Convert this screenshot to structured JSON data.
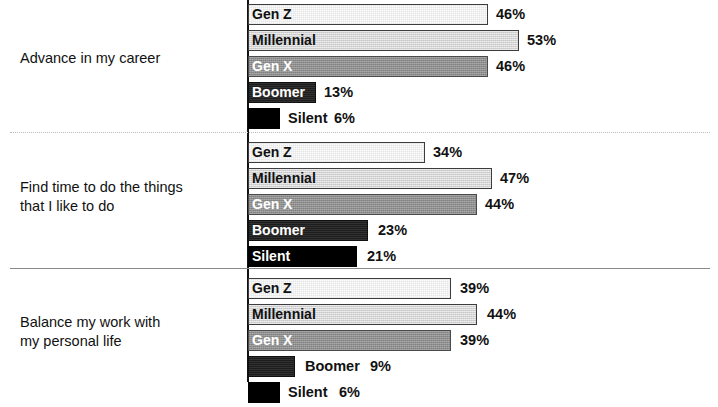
{
  "chart_data": {
    "type": "bar",
    "orientation": "horizontal",
    "title": "",
    "subtitle": "",
    "xlabel": "",
    "ylabel": "",
    "xlim": [
      0,
      60
    ],
    "grid": false,
    "legend": "inline-bar-labels",
    "value_suffix": "%",
    "px_per_percent": 5.2,
    "axis_x_px": 248,
    "series": [
      {
        "name": "Gen Z",
        "values": [
          46,
          34,
          39
        ]
      },
      {
        "name": "Millennial",
        "values": [
          53,
          47,
          44
        ]
      },
      {
        "name": "Gen X",
        "values": [
          46,
          44,
          39
        ]
      },
      {
        "name": "Boomer",
        "values": [
          13,
          23,
          9
        ]
      },
      {
        "name": "Silent",
        "values": [
          6,
          21,
          6
        ]
      }
    ],
    "categories": [
      "Advance in my career",
      "Find time to do the things that I like to do",
      "Balance my work with my personal life"
    ],
    "colors": {
      "gen_z": "#fbfbfb",
      "millennial": "#d4d4d4",
      "gen_x": "#8f8f8f",
      "boomer": "#1d1d1d",
      "silent": "#000000",
      "axis": "#111111",
      "separator_dotted": "#bdbdbd",
      "separator_solid": "#8a8a8a",
      "text": "#111111"
    }
  },
  "groups": [
    {
      "label": "Advance in my career",
      "top": 4,
      "label_top": 49,
      "bars": [
        {
          "name": "Gen Z",
          "value": "46%",
          "label": "Gen Z",
          "width": 240,
          "label_inside": true,
          "label_color": "dark",
          "value_left": 248
        },
        {
          "name": "Millennial",
          "value": "53%",
          "label": "Millennial",
          "width": 271,
          "label_inside": true,
          "label_color": "dark",
          "value_left": 279
        },
        {
          "name": "Gen X",
          "value": "46%",
          "label": "Gen X",
          "width": 240,
          "label_inside": true,
          "label_color": "light",
          "value_left": 248
        },
        {
          "name": "Boomer",
          "value": "13%",
          "label": "Boomer",
          "width": 68,
          "label_inside": true,
          "label_color": "light",
          "value_left": 76
        },
        {
          "name": "Silent",
          "value": "6%",
          "label": "Silent",
          "width": 32,
          "label_inside": false,
          "label_color": "dark",
          "label_left": 40,
          "value_left": 86
        }
      ]
    },
    {
      "label": "Find time to do the things\nthat I like to do",
      "top": 142,
      "label_top": 178,
      "bars": [
        {
          "name": "Gen Z",
          "value": "34%",
          "label": "Gen Z",
          "width": 177,
          "label_inside": true,
          "label_color": "dark",
          "value_left": 185
        },
        {
          "name": "Millennial",
          "value": "47%",
          "label": "Millennial",
          "width": 244,
          "label_inside": true,
          "label_color": "dark",
          "value_left": 252
        },
        {
          "name": "Gen X",
          "value": "44%",
          "label": "Gen X",
          "width": 229,
          "label_inside": true,
          "label_color": "light",
          "value_left": 237
        },
        {
          "name": "Boomer",
          "value": "23%",
          "label": "Boomer",
          "width": 120,
          "label_inside": true,
          "label_color": "light",
          "value_left": 130
        },
        {
          "name": "Silent",
          "value": "21%",
          "label": "Silent",
          "width": 109,
          "label_inside": true,
          "label_color": "light",
          "value_left": 119
        }
      ]
    },
    {
      "label": "Balance my work with\nmy personal life",
      "top": 278,
      "label_top": 313,
      "bars": [
        {
          "name": "Gen Z",
          "value": "39%",
          "label": "Gen Z",
          "width": 203,
          "label_inside": true,
          "label_color": "dark",
          "value_left": 212
        },
        {
          "name": "Millennial",
          "value": "44%",
          "label": "Millennial",
          "width": 229,
          "label_inside": true,
          "label_color": "dark",
          "value_left": 239
        },
        {
          "name": "Gen X",
          "value": "39%",
          "label": "Gen X",
          "width": 203,
          "label_inside": true,
          "label_color": "light",
          "value_left": 212
        },
        {
          "name": "Boomer",
          "value": "9%",
          "label": "Boomer",
          "width": 47,
          "label_inside": false,
          "label_color": "dark",
          "label_left": 57,
          "value_left": 122
        },
        {
          "name": "Silent",
          "value": "6%",
          "label": "Silent",
          "width": 32,
          "label_inside": false,
          "label_color": "dark",
          "label_left": 40,
          "value_left": 91
        }
      ]
    }
  ]
}
